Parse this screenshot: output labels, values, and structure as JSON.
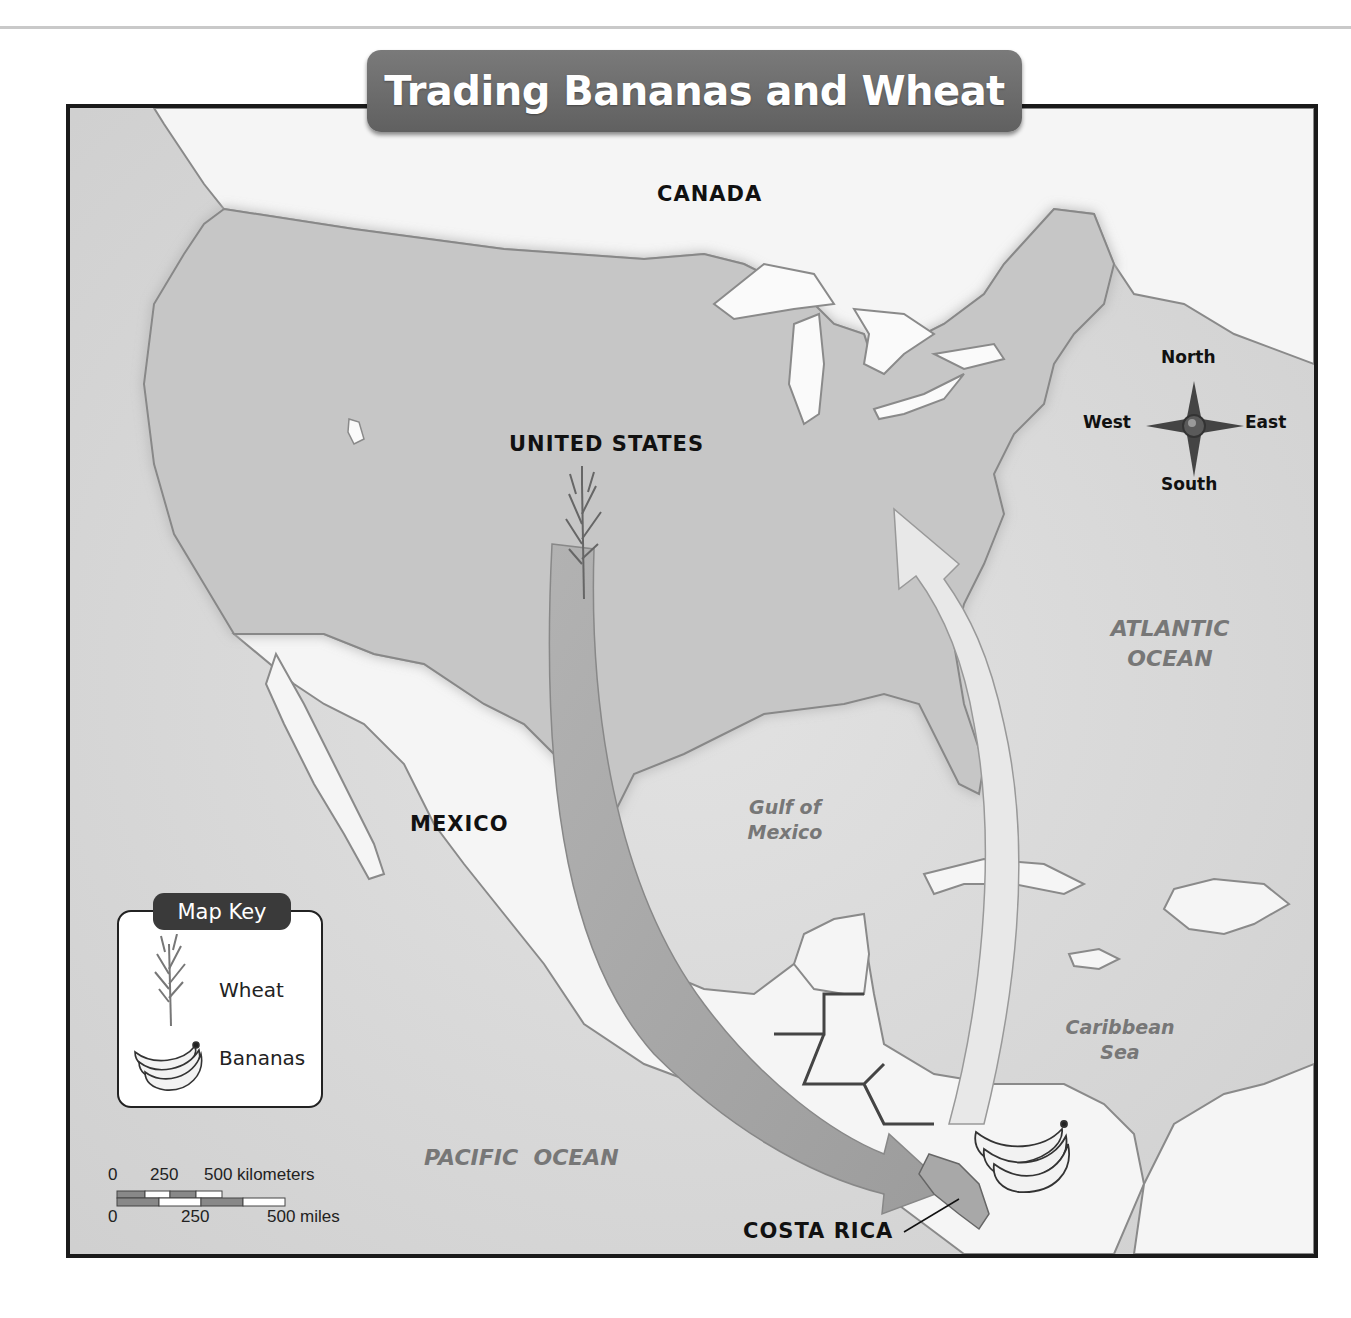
{
  "title": "Trading Bananas and Wheat",
  "countries": {
    "canada": "CANADA",
    "united_states": "UNITED STATES",
    "mexico": "MEXICO",
    "costa_rica": "COSTA RICA"
  },
  "water_bodies": {
    "atlantic_line1": "ATLANTIC",
    "atlantic_line2": "OCEAN",
    "gulf_line1": "Gulf of",
    "gulf_line2": "Mexico",
    "caribbean_line1": "Caribbean",
    "caribbean_line2": "Sea",
    "pacific": "PACIFIC  OCEAN"
  },
  "compass": {
    "north": "North",
    "south": "South",
    "east": "East",
    "west": "West"
  },
  "map_key": {
    "title": "Map Key",
    "items": [
      {
        "icon": "wheat-icon",
        "label": "Wheat"
      },
      {
        "icon": "bananas-icon",
        "label": "Bananas"
      }
    ]
  },
  "scale_bar": {
    "km_0": "0",
    "km_250": "250",
    "km_500": "500 kilometers",
    "mi_0": "0",
    "mi_250": "250",
    "mi_500": "500 miles"
  },
  "trade_routes": [
    {
      "good": "Wheat",
      "from": "UNITED STATES",
      "to": "COSTA RICA",
      "arrow_color": "#a8a8a8"
    },
    {
      "good": "Bananas",
      "from": "COSTA RICA",
      "to": "UNITED STATES",
      "arrow_color": "#e6e6e6"
    }
  ],
  "colors": {
    "ocean": "#d6d6d6",
    "us_land": "#c8c8c8",
    "other_land": "#f4f4f4",
    "title_banner": "#6b6b6b",
    "frame": "#1a1a1a"
  }
}
